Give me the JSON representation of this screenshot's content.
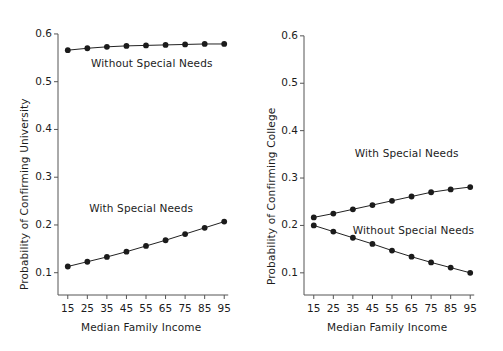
{
  "chart_data": [
    {
      "type": "line",
      "panel": "left",
      "title": "",
      "xlabel": "Median Family Income",
      "ylabel": "Probability of Confirming University",
      "x": [
        15,
        25,
        35,
        45,
        55,
        65,
        75,
        85,
        95
      ],
      "xticks": [
        15,
        25,
        35,
        45,
        55,
        65,
        75,
        85,
        95
      ],
      "yticks": [
        0.1,
        0.2,
        0.3,
        0.4,
        0.5,
        0.6
      ],
      "ytick_labels": [
        "0.1",
        "0.2",
        "0.3",
        "0.4",
        "0.5",
        "0.6"
      ],
      "xlim": [
        10,
        100
      ],
      "ylim": [
        0.068,
        0.625
      ],
      "grid": false,
      "legend_position": "inline-annotation",
      "series": [
        {
          "name": "Without Special Needs",
          "values": [
            0.566,
            0.57,
            0.573,
            0.575,
            0.576,
            0.577,
            0.578,
            0.579,
            0.579
          ],
          "annotation_x": 55,
          "annotation_y": 0.535
        },
        {
          "name": "With Special Needs",
          "values": [
            0.113,
            0.123,
            0.133,
            0.144,
            0.156,
            0.168,
            0.181,
            0.194,
            0.207
          ],
          "annotation_x": 52,
          "annotation_y": 0.232
        }
      ]
    },
    {
      "type": "line",
      "panel": "right",
      "title": "",
      "xlabel": "Median Family Income",
      "ylabel": "Probability of Confirming College",
      "x": [
        15,
        25,
        35,
        45,
        55,
        65,
        75,
        85,
        95
      ],
      "xticks": [
        15,
        25,
        35,
        45,
        55,
        65,
        75,
        85,
        95
      ],
      "yticks": [
        0.1,
        0.2,
        0.3,
        0.4,
        0.5,
        0.6
      ],
      "ytick_labels": [
        "0.1",
        "0.2",
        "0.3",
        "0.4",
        "0.5",
        "0.6"
      ],
      "xlim": [
        10,
        100
      ],
      "ylim": [
        0.068,
        0.625
      ],
      "grid": false,
      "legend_position": "inline-annotation",
      "series": [
        {
          "name": "With Special Needs",
          "values": [
            0.217,
            0.225,
            0.234,
            0.243,
            0.252,
            0.261,
            0.27,
            0.276,
            0.281
          ],
          "annotation_x": 62,
          "annotation_y": 0.348
        },
        {
          "name": "Without Special Needs",
          "values": [
            0.2,
            0.187,
            0.174,
            0.161,
            0.147,
            0.134,
            0.122,
            0.111,
            0.1
          ],
          "annotation_x": 63,
          "annotation_y": 0.186
        }
      ]
    }
  ],
  "colors": {
    "line": "#222222",
    "point": "#1b1b1b",
    "axis": "#555555",
    "text": "#1c1c1c",
    "background": "#ffffff"
  }
}
